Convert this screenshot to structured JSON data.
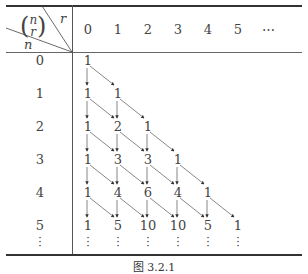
{
  "header": {
    "corner_symbol_top": "n",
    "corner_symbol_bottom": "r",
    "col_var": "r",
    "row_var": "n",
    "columns": [
      "0",
      "1",
      "2",
      "3",
      "4",
      "5",
      "⋯"
    ]
  },
  "rows": [
    {
      "n": "0",
      "values": [
        "1"
      ]
    },
    {
      "n": "1",
      "values": [
        "1",
        "1"
      ]
    },
    {
      "n": "2",
      "values": [
        "1",
        "2",
        "1"
      ]
    },
    {
      "n": "3",
      "values": [
        "1",
        "3",
        "3",
        "1"
      ]
    },
    {
      "n": "4",
      "values": [
        "1",
        "4",
        "6",
        "4",
        "1"
      ]
    },
    {
      "n": "5",
      "values": [
        "1",
        "5",
        "10",
        "10",
        "5",
        "1"
      ]
    }
  ],
  "continuation": "⋮",
  "caption": "图 3.2.1"
}
